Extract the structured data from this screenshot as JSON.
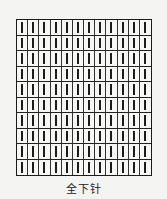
{
  "diagram": {
    "caption": "全下针",
    "columns": 12,
    "rows": 10,
    "stitch_symbol": "vertical-bar",
    "colors": {
      "line": "#1a1a1a",
      "background": "#f4f4f2"
    }
  }
}
